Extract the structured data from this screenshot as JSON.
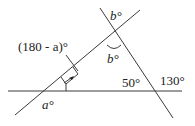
{
  "diagram": {
    "labels": {
      "supplementary_angle": "(180 - a)°",
      "top_angle": "b°",
      "inner_angle": "b°",
      "angle_a": "a°",
      "angle_50": "50°",
      "angle_130": "130°"
    },
    "lines": [
      {
        "name": "horizontal-line"
      },
      {
        "name": "rising-diagonal-line"
      },
      {
        "name": "falling-diagonal-line"
      }
    ],
    "markers": {
      "right_angle": "right-angle-marker",
      "arrow": "arrow-pointer",
      "arc": "angle-arc-b"
    }
  }
}
